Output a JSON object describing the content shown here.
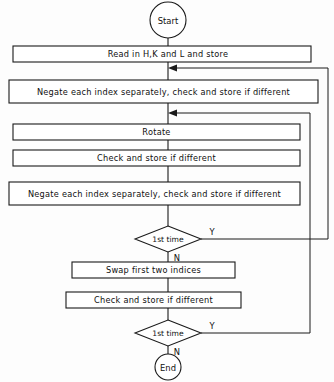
{
  "diagram": {
    "colors": {
      "background": "#fdfdfd",
      "shape_fill": "#ffffff",
      "stroke": "#1a1a1a",
      "text": "#101010"
    },
    "nodes": {
      "start": {
        "label": "Start",
        "type": "terminator"
      },
      "read": {
        "label": "Read in H,K and L and store",
        "type": "process"
      },
      "negate1": {
        "label": "Negate each index separately, check and store if different",
        "type": "process"
      },
      "rotate": {
        "label": "Rotate",
        "type": "process"
      },
      "check1": {
        "label": "Check and store if different",
        "type": "process"
      },
      "negate2": {
        "label": "Negate each index separately, check and store if different",
        "type": "process"
      },
      "decision1": {
        "label": "1st time",
        "type": "decision"
      },
      "swap": {
        "label": "Swap first two indices",
        "type": "process"
      },
      "check2": {
        "label": "Check and store if different",
        "type": "process"
      },
      "decision2": {
        "label": "1st time",
        "type": "decision"
      },
      "end": {
        "label": "End",
        "type": "terminator"
      }
    },
    "branch_labels": {
      "d1_yes": "Y",
      "d1_no": "N",
      "d2_yes": "Y",
      "d2_no": "N"
    }
  }
}
